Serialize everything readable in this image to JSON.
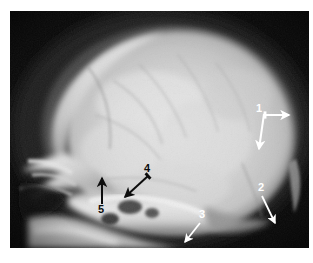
{
  "figure": {
    "type": "radiograph",
    "modality": "x-ray",
    "view": "lateral skull",
    "background_color": "#ffffff",
    "plate_color": "#080808"
  },
  "annotations": [
    {
      "id": "annotation-1",
      "label": "1",
      "color": "#ffffff",
      "color_name": "white",
      "label_x": 249,
      "label_y": 97,
      "arrows": [
        {
          "name": "arrow-1-right",
          "direction": "right",
          "x1": 255,
          "y1": 104,
          "x2": 279,
          "y2": 104
        },
        {
          "name": "arrow-1-down",
          "direction": "down",
          "x1": 253,
          "y1": 105,
          "x2": 249,
          "y2": 138
        }
      ]
    },
    {
      "id": "annotation-2",
      "label": "2",
      "color": "#ffffff",
      "color_name": "white",
      "label_x": 252,
      "label_y": 176,
      "arrows": [
        {
          "name": "arrow-2",
          "direction": "down-right",
          "x1": 252,
          "y1": 185,
          "x2": 265,
          "y2": 213
        }
      ]
    },
    {
      "id": "annotation-3",
      "label": "3",
      "color": "#ffffff",
      "color_name": "white",
      "label_x": 192,
      "label_y": 203,
      "arrows": [
        {
          "name": "arrow-3",
          "direction": "down-left",
          "x1": 191,
          "y1": 212,
          "x2": 175,
          "y2": 232
        }
      ]
    },
    {
      "id": "annotation-4",
      "label": "4",
      "color": "#0d0d0d",
      "color_name": "black",
      "label_x": 133,
      "label_y": 157,
      "arrows": [
        {
          "name": "arrow-4",
          "direction": "down-left",
          "x1": 137,
          "y1": 166,
          "x2": 115,
          "y2": 186
        }
      ]
    },
    {
      "id": "annotation-5",
      "label": "5",
      "color": "#0d0d0d",
      "color_name": "black",
      "label_x": 87,
      "label_y": 196,
      "arrows": [
        {
          "name": "arrow-5",
          "direction": "up",
          "x1": 92,
          "y1": 194,
          "x2": 92,
          "y2": 167
        }
      ]
    }
  ],
  "image_regions": {
    "cranial_vault": "bright dome occupying the upper two-thirds of the plate",
    "frontal_bone": "upper left curved bright ridge",
    "facial_skeleton": "left lower bright mottled structures",
    "skull_base": "lower central bright band",
    "occiput": "right rounded bright margin",
    "air_background": "near-black surround"
  },
  "tones": {
    "plate_black": "#080808",
    "soft_tissue_dark": "#2a2a2a",
    "bone_mid": "#9a9a9a",
    "bone_bright": "#d9d9d9",
    "bone_brightest": "#f2f2f2"
  }
}
